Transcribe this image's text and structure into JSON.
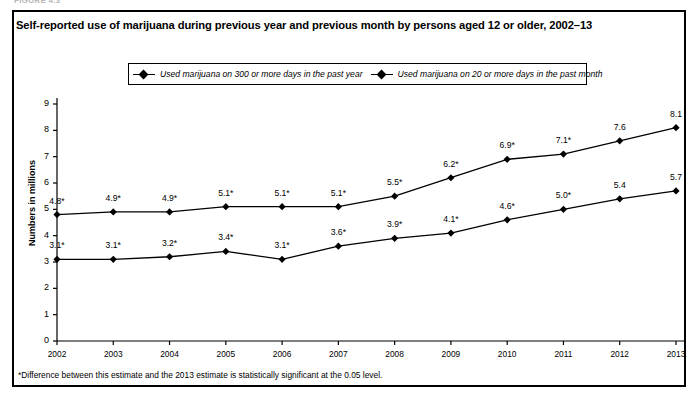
{
  "figure": {
    "label": "FIGURE 4.3"
  },
  "header": {
    "title": "Self-reported use of marijuana during previous year and previous month by persons aged 12 or older, 2002–13"
  },
  "legend": {
    "items": [
      {
        "label": "Used marijuana on 300 or more days in the past year",
        "marker": "diamond-marker"
      },
      {
        "label": "Used marijuana on 20 or more days in the past month",
        "marker": "diamond-marker"
      }
    ]
  },
  "footnote": {
    "text": "*Difference between this estimate and the 2013 estimate is statistically significant at the 0.05 level."
  },
  "chart_data": {
    "type": "line",
    "title": "Self-reported use of marijuana during previous year and previous month by persons aged 12 or older, 2002–13",
    "xlabel": "",
    "ylabel": "Numbers in millions",
    "ylim": [
      0,
      9
    ],
    "yticks": [
      "0",
      "1",
      "2",
      "3",
      "4",
      "5",
      "6",
      "7",
      "8",
      "9"
    ],
    "grid": false,
    "legend_position": "top",
    "categories": [
      "2002",
      "2003",
      "2004",
      "2005",
      "2006",
      "2007",
      "2008",
      "2009",
      "2010",
      "2011",
      "2012",
      "2013"
    ],
    "series": [
      {
        "name": "Used marijuana on 20 or more days in the past month",
        "values": [
          4.8,
          4.9,
          4.9,
          5.1,
          5.1,
          5.1,
          5.5,
          6.2,
          6.9,
          7.1,
          7.6,
          8.1
        ],
        "labels": [
          "4.8*",
          "4.9*",
          "4.9*",
          "5.1*",
          "5.1*",
          "5.1*",
          "5.5*",
          "6.2*",
          "6.9*",
          "7.1*",
          "7.6",
          "8.1"
        ]
      },
      {
        "name": "Used marijuana on 300 or more days in the past year",
        "values": [
          3.1,
          3.1,
          3.2,
          3.4,
          3.1,
          3.6,
          3.9,
          4.1,
          4.6,
          5.0,
          5.4,
          5.7
        ],
        "labels": [
          "3.1*",
          "3.1*",
          "3.2*",
          "3.4*",
          "3.1*",
          "3.6*",
          "3.9*",
          "4.1*",
          "4.6*",
          "5.0*",
          "5.4",
          "5.7"
        ]
      }
    ]
  },
  "colors": {
    "line": "#000000",
    "frame": "#000000",
    "background": "#ffffff"
  }
}
